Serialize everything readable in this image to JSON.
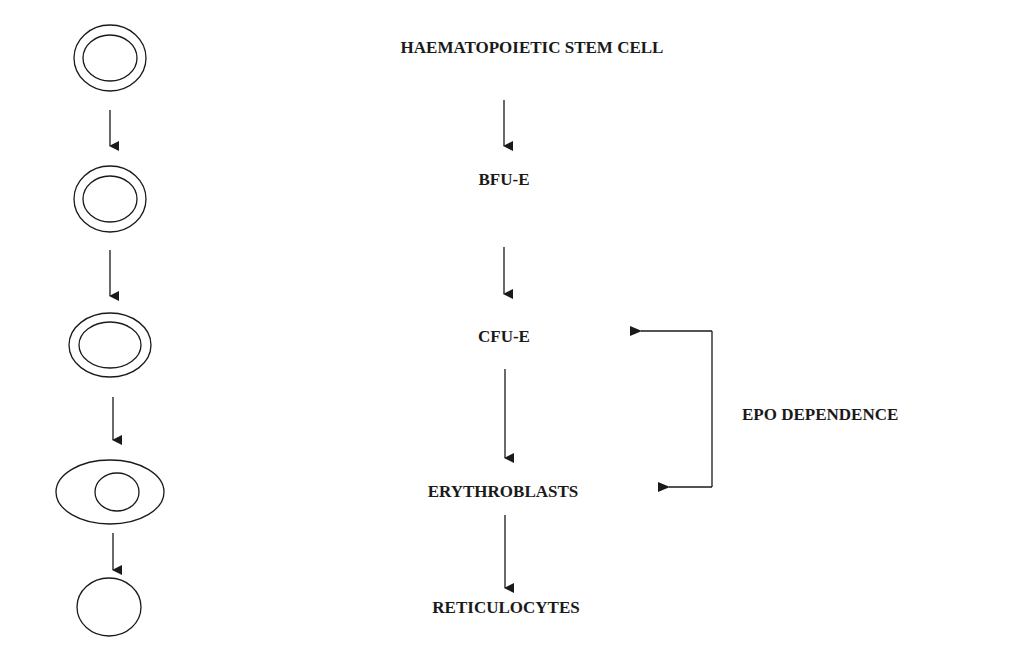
{
  "diagram": {
    "type": "flowchart",
    "stages": [
      {
        "label": "HAEMATOPOIETIC STEM CELL",
        "cell_shape": "double-ring-circle"
      },
      {
        "label": "BFU-E",
        "cell_shape": "double-ring-circle"
      },
      {
        "label": "CFU-E",
        "cell_shape": "double-ring-oval"
      },
      {
        "label": "ERYTHROBLASTS",
        "cell_shape": "oval-with-nucleus"
      },
      {
        "label": "RETICULOCYTES",
        "cell_shape": "plain-circle"
      }
    ],
    "bracket": {
      "label": "EPO DEPENDENCE",
      "from": "CFU-E",
      "to": "ERYTHROBLASTS"
    },
    "colors": {
      "stroke": "#1a1a1a",
      "background": "#ffffff"
    }
  }
}
